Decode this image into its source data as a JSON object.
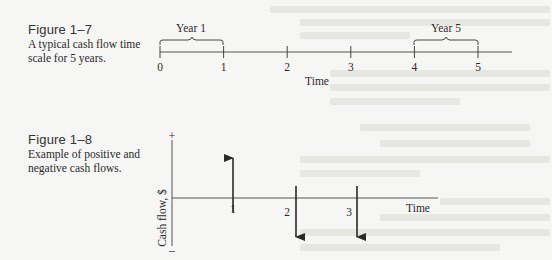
{
  "figure_1_7": {
    "label": "Figure 1–7",
    "caption_lines": [
      "A typical cash flow time",
      "scale for 5 years."
    ],
    "tick_labels": [
      "0",
      "1",
      "2",
      "3",
      "4",
      "5"
    ],
    "brace_labels": [
      "Year 1",
      "Year 5"
    ],
    "axis_label": "Time"
  },
  "figure_1_8": {
    "label": "Figure 1–8",
    "caption_lines": [
      "Example of positive and",
      "negative cash flows."
    ],
    "y_axis_label": "Cash flow, $",
    "plus_sign": "+",
    "minus_sign": "–",
    "x_axis_label": "Time",
    "flows": [
      {
        "period": "1",
        "direction": "positive"
      },
      {
        "period": "2",
        "direction": "negative"
      },
      {
        "period": "3",
        "direction": "negative"
      }
    ]
  },
  "colors": {
    "ink": "#2a2a2a",
    "axis": "#555555",
    "paper": "#f6f6f4"
  }
}
